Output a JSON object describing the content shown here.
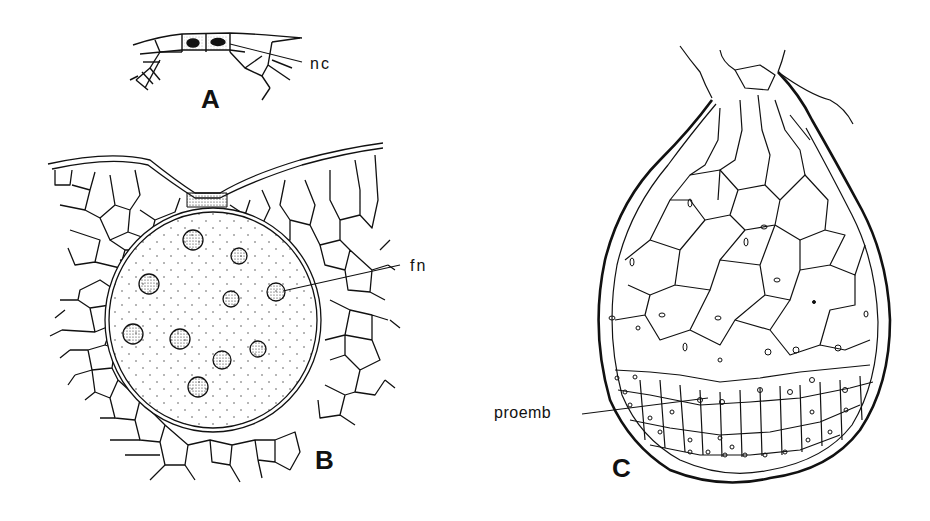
{
  "figure": {
    "panels": [
      {
        "id": "A",
        "label": "A",
        "annotations": [
          {
            "text": "nc",
            "meaning": "neck canal cells"
          }
        ]
      },
      {
        "id": "B",
        "label": "B",
        "annotations": [
          {
            "text": "fn",
            "meaning": "free nuclei"
          }
        ]
      },
      {
        "id": "C",
        "label": "C",
        "annotations": [
          {
            "text": "proemb",
            "meaning": "proembryo"
          }
        ]
      }
    ],
    "colors": {
      "ink": "#111111",
      "background": "#ffffff"
    }
  }
}
